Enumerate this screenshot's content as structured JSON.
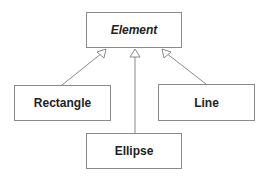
{
  "diagram": {
    "type": "uml-class-inheritance",
    "classes": [
      {
        "id": "element",
        "name": "Element",
        "abstract": true
      },
      {
        "id": "rectangle",
        "name": "Rectangle",
        "abstract": false
      },
      {
        "id": "ellipse",
        "name": "Ellipse",
        "abstract": false
      },
      {
        "id": "line",
        "name": "Line",
        "abstract": false
      }
    ],
    "relations": [
      {
        "from": "Rectangle",
        "to": "Element",
        "kind": "generalization"
      },
      {
        "from": "Ellipse",
        "to": "Element",
        "kind": "generalization"
      },
      {
        "from": "Line",
        "to": "Element",
        "kind": "generalization"
      }
    ],
    "colors": {
      "stroke": "#8a8a8a",
      "text": "#222222",
      "fill": "#ffffff"
    }
  }
}
